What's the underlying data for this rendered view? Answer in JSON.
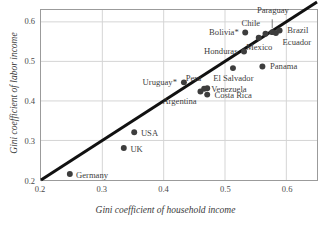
{
  "chart_data": {
    "type": "scatter",
    "title": "",
    "xlabel": "Gini coefficient of household income",
    "ylabel": "Gini coefficient of labor income",
    "xlim": [
      0.2,
      0.65
    ],
    "ylim": [
      0.2,
      0.63
    ],
    "xticks": [
      "0.2",
      "0.3",
      "0.4",
      "0.5",
      "0.6"
    ],
    "xtick_values": [
      0.2,
      0.3,
      0.4,
      0.5,
      0.6
    ],
    "yticks": [
      "0.2",
      "0.3",
      "0.4",
      "0.5",
      "0.6"
    ],
    "ytick_values": [
      0.2,
      0.3,
      0.4,
      0.5,
      0.6
    ],
    "grid": true,
    "legend": "none",
    "reference_line": {
      "name": "45-degree identity line",
      "from": [
        0.2,
        0.2
      ],
      "to": [
        0.65,
        0.65
      ],
      "color": "#111111",
      "width_px": 3
    },
    "marker": {
      "shape": "circle",
      "color": "#3d3d3d",
      "size_px": 6
    },
    "points": [
      {
        "label": "Germany",
        "x": 0.247,
        "y": 0.215,
        "label_pos": "e"
      },
      {
        "label": "UK",
        "x": 0.335,
        "y": 0.281,
        "label_pos": "e"
      },
      {
        "label": "USA",
        "x": 0.352,
        "y": 0.321,
        "label_pos": "e"
      },
      {
        "label": "Uruguay*",
        "x": 0.433,
        "y": 0.447,
        "label_pos": "w"
      },
      {
        "label": "Peru",
        "x": 0.471,
        "y": 0.432,
        "label_pos": "nw"
      },
      {
        "label": "Argentina",
        "x": 0.46,
        "y": 0.424,
        "label_pos": "sw"
      },
      {
        "label": "Venezuela",
        "x": 0.466,
        "y": 0.431,
        "label_pos": "e"
      },
      {
        "label": "Costa Rica",
        "x": 0.471,
        "y": 0.416,
        "label_pos": "e"
      },
      {
        "label": "El Salvador",
        "x": 0.513,
        "y": 0.483,
        "label_pos": "s"
      },
      {
        "label": "Honduras",
        "x": 0.531,
        "y": 0.525,
        "label_pos": "w"
      },
      {
        "label": "Bolivia*",
        "x": 0.533,
        "y": 0.573,
        "label_pos": "w"
      },
      {
        "label": "Panama",
        "x": 0.561,
        "y": 0.487,
        "label_pos": "e"
      },
      {
        "label": "Mexico",
        "x": 0.555,
        "y": 0.56,
        "label_pos": "s"
      },
      {
        "label": "Chile",
        "x": 0.566,
        "y": 0.57,
        "label_pos": "nw"
      },
      {
        "label": "Paraguay",
        "x": 0.577,
        "y": 0.574,
        "label_pos": "n"
      },
      {
        "label": "Ecuador",
        "x": 0.583,
        "y": 0.572,
        "label_pos": "se"
      },
      {
        "label": "Brazil",
        "x": 0.589,
        "y": 0.578,
        "label_pos": "e"
      }
    ],
    "annotations": [
      {
        "text": "* asterisk denotes country footnote marker",
        "rendered": false
      }
    ],
    "colors": {
      "marker": "#3d3d3d",
      "line": "#111111",
      "grid": "#d5d5d5",
      "frame": "#9b9b9b",
      "text": "#3a3a3a",
      "background": "#ffffff"
    }
  }
}
